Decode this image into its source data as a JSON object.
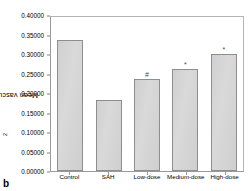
{
  "panel": {
    "label": "b"
  },
  "chart_data": {
    "type": "bar",
    "title": "",
    "xlabel": "",
    "ylabel": "Mean vascular area (mm",
    "ylabel_superscript": "2",
    "ylabel_suffix": ")",
    "ylabel_full": "Mean vascular area (mm²)",
    "categories": [
      "Control",
      "SAH",
      "Low-dose",
      "Medium-dose",
      "High-dose"
    ],
    "values": [
      0.335,
      0.183,
      0.235,
      0.262,
      0.3
    ],
    "annotations": [
      "",
      "",
      "#",
      "*",
      "*"
    ],
    "ylim": [
      0.0,
      0.4
    ],
    "ytick_step": 0.05,
    "yticks": [
      "0.40000",
      "0.35000",
      "0.30000",
      "0.25000",
      "0.20000",
      "0.15000",
      "0.10000",
      "0.05000",
      "0.00000"
    ],
    "ytick_values": [
      0.4,
      0.35,
      0.3,
      0.25,
      0.2,
      0.15,
      0.1,
      0.05,
      0.0
    ],
    "grid": false,
    "legend": false,
    "bar_fill_color": "#d3d3d3",
    "bar_border_color": "#8e8e8e",
    "frame_color": "#9a9a9a"
  }
}
